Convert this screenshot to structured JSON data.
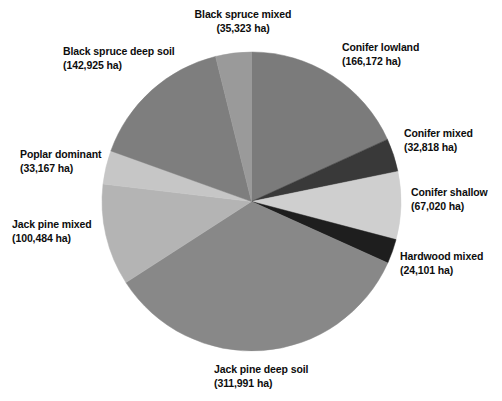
{
  "chart_data": {
    "type": "pie",
    "title": "",
    "subtitle": "",
    "units": "ha",
    "total": 913001,
    "legend_position": "outside-labels",
    "start_angle_deg": 0,
    "direction": "clockwise",
    "categories": [
      "Conifer lowland",
      "Conifer mixed",
      "Conifer shallow",
      "Hardwood mixed",
      "Jack pine deep soil",
      "Jack pine mixed",
      "Poplar dominant",
      "Black spruce deep soil",
      "Black spruce mixed"
    ],
    "values": [
      166172,
      32818,
      67020,
      24101,
      311991,
      100484,
      33167,
      142925,
      35323
    ],
    "slices": [
      {
        "name": "Conifer lowland",
        "value": 166172,
        "value_label": "(166,172 ha)",
        "percent": 18.2,
        "angle_deg": 65.52,
        "color": "#7b7b7b"
      },
      {
        "name": "Conifer mixed",
        "value": 32818,
        "value_label": "(32,818 ha)",
        "percent": 3.6,
        "angle_deg": 12.94,
        "color": "#393939"
      },
      {
        "name": "Conifer shallow",
        "value": 67020,
        "value_label": "(67,020 ha)",
        "percent": 7.34,
        "angle_deg": 26.43,
        "color": "#cfcfcf"
      },
      {
        "name": "Hardwood mixed",
        "value": 24101,
        "value_label": "(24,101 ha)",
        "percent": 2.64,
        "angle_deg": 9.5,
        "color": "#1e1e1e"
      },
      {
        "name": "Jack pine deep soil",
        "value": 311991,
        "value_label": "(311,991 ha)",
        "percent": 34.17,
        "angle_deg": 123.01,
        "color": "#888888"
      },
      {
        "name": "Jack pine mixed",
        "value": 100484,
        "value_label": "(100,484 ha)",
        "percent": 11.01,
        "angle_deg": 39.62,
        "color": "#b4b4b4"
      },
      {
        "name": "Poplar dominant",
        "value": 33167,
        "value_label": "(33,167 ha)",
        "percent": 3.63,
        "angle_deg": 13.08,
        "color": "#c6c6c6"
      },
      {
        "name": "Black spruce deep soil",
        "value": 142925,
        "value_label": "(142,925 ha)",
        "percent": 15.65,
        "angle_deg": 56.35,
        "color": "#7e7e7e"
      },
      {
        "name": "Black spruce mixed",
        "value": 35323,
        "value_label": "(35,323 ha)",
        "percent": 3.87,
        "angle_deg": 13.93,
        "color": "#9a9a9a"
      }
    ]
  },
  "labels": {
    "black_spruce_mixed": {
      "name": "Black spruce mixed",
      "value": "(35,323 ha)"
    },
    "black_spruce_deep_soil": {
      "name": "Black spruce deep soil",
      "value": "(142,925 ha)"
    },
    "conifer_lowland": {
      "name": "Conifer lowland",
      "value": "(166,172 ha)"
    },
    "conifer_mixed": {
      "name": "Conifer mixed",
      "value": "(32,818 ha)"
    },
    "conifer_shallow": {
      "name": "Conifer shallow",
      "value": "(67,020 ha)"
    },
    "hardwood_mixed": {
      "name": "Hardwood mixed",
      "value": "(24,101 ha)"
    },
    "jack_pine_deep_soil": {
      "name": "Jack pine deep soil",
      "value": "(311,991 ha)"
    },
    "jack_pine_mixed": {
      "name": "Jack pine mixed",
      "value": "(100,484 ha)"
    },
    "poplar_dominant": {
      "name": "Poplar dominant",
      "value": "(33,167 ha)"
    }
  }
}
